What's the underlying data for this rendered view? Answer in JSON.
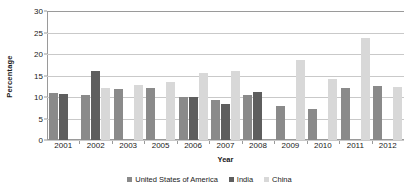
{
  "chart_data": {
    "type": "bar",
    "title": "",
    "xlabel": "Year",
    "ylabel": "Percentage",
    "ylim": [
      0,
      30
    ],
    "yticks": [
      0,
      5,
      10,
      15,
      20,
      25,
      30
    ],
    "grid": true,
    "legend_position": "bottom",
    "categories": [
      "2001",
      "2002",
      "2003",
      "2005",
      "2006",
      "2007",
      "2008",
      "2009",
      "2010",
      "2011",
      "2012"
    ],
    "series": [
      {
        "name": "United States of America",
        "color": "#8a8a8a",
        "values": [
          11.0,
          10.5,
          11.8,
          12.2,
          9.9,
          9.3,
          10.5,
          7.8,
          7.3,
          12.0,
          12.5
        ]
      },
      {
        "name": "India",
        "color": "#5e5e5e",
        "values": [
          10.7,
          16.0,
          null,
          null,
          10.0,
          8.3,
          11.2,
          null,
          null,
          null,
          null
        ]
      },
      {
        "name": "China",
        "color": "#d8d8d8",
        "values": [
          null,
          12.0,
          12.7,
          13.6,
          15.6,
          16.1,
          null,
          18.5,
          14.1,
          23.8,
          12.4
        ]
      }
    ]
  }
}
